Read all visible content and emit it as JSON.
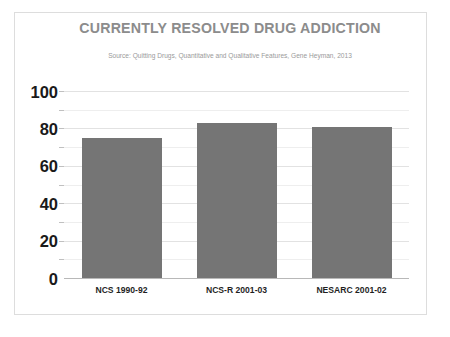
{
  "chart_data": {
    "type": "bar",
    "title": "CURRENTLY RESOLVED DRUG ADDICTION",
    "subtitle": "Source: Quitting Drugs, Quantitative and Qualitative Features, Gene Heyman, 2013",
    "categories": [
      "NCS 1990-92",
      "NCS-R 2001-03",
      "NESARC 2001-02"
    ],
    "values": [
      75,
      83,
      81
    ],
    "xlabel": "",
    "ylabel": "",
    "ylim": [
      0,
      100
    ],
    "yticks": [
      0,
      20,
      40,
      60,
      80,
      100
    ],
    "ytick_labels": [
      "0",
      "20",
      "40",
      "60",
      "80",
      "100"
    ],
    "minor_yticks": [
      10,
      30,
      50,
      70,
      90
    ],
    "grid": true,
    "legend": false,
    "bar_color": "#757575",
    "title_color": "#8c8c8c",
    "subtitle_color": "#9a9a9a",
    "gridline_color": "#e2e2e2",
    "frame_color": "#dddddd"
  }
}
